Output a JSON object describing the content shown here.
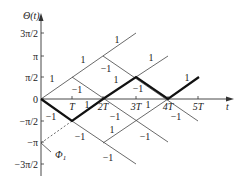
{
  "diagram": {
    "y_axis_label": "Θ(t)",
    "x_axis_label": "t",
    "y_ticks": [
      {
        "label": "3π/2",
        "y": 33
      },
      {
        "label": "π",
        "y": 56
      },
      {
        "label": "π/2",
        "y": 77
      },
      {
        "label": "0",
        "y": 99
      },
      {
        "label": "−π/2",
        "y": 121
      },
      {
        "label": "−π",
        "y": 142
      },
      {
        "label": "−3π/2",
        "y": 164
      }
    ],
    "x_ticks": [
      {
        "label": "T",
        "x": 72
      },
      {
        "label": "2T",
        "x": 103
      },
      {
        "label": "3T",
        "x": 136
      },
      {
        "label": "4T",
        "x": 168
      },
      {
        "label": "5T",
        "x": 198
      }
    ],
    "phase_label": "Φ1",
    "phase_label_main": "Φ",
    "phase_label_sub": "1",
    "thin_lines": [
      [
        41,
        99,
        136,
        33
      ],
      [
        72,
        77,
        168,
        142
      ],
      [
        103,
        56,
        198,
        121
      ],
      [
        136,
        77,
        168,
        56
      ],
      [
        72,
        121,
        136,
        164
      ],
      [
        103,
        143,
        168,
        99
      ]
    ],
    "bold_path": [
      [
        41,
        99
      ],
      [
        72,
        121
      ],
      [
        103,
        99
      ],
      [
        136,
        77
      ],
      [
        168,
        99
      ],
      [
        199,
        77
      ]
    ],
    "dashed_line": [
      41,
      143,
      72,
      121
    ],
    "leader_line": [
      41,
      143,
      51,
      152
    ],
    "branch_labels": [
      {
        "text": "1",
        "x": 52,
        "y": 82
      },
      {
        "text": "1",
        "x": 83,
        "y": 63
      },
      {
        "text": "1",
        "x": 117,
        "y": 43
      },
      {
        "text": "−1",
        "x": 77,
        "y": 93
      },
      {
        "text": "−1",
        "x": 106,
        "y": 72
      },
      {
        "text": "1",
        "x": 116,
        "y": 83
      },
      {
        "text": "1",
        "x": 151,
        "y": 61
      },
      {
        "text": "−1",
        "x": 138,
        "y": 92
      },
      {
        "text": "1",
        "x": 187,
        "y": 81
      },
      {
        "text": "1",
        "x": 87,
        "y": 108
      },
      {
        "text": "1",
        "x": 148,
        "y": 108
      },
      {
        "text": "−1",
        "x": 51,
        "y": 120
      },
      {
        "text": "−1",
        "x": 115,
        "y": 120
      },
      {
        "text": "−1",
        "x": 176,
        "y": 120
      },
      {
        "text": "−1",
        "x": 80,
        "y": 140
      },
      {
        "text": "1",
        "x": 112,
        "y": 133
      },
      {
        "text": "−1",
        "x": 145,
        "y": 140
      },
      {
        "text": "−1",
        "x": 108,
        "y": 161
      }
    ]
  }
}
